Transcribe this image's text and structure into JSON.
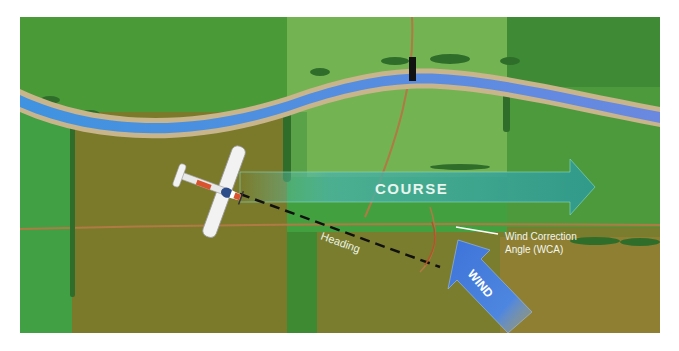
{
  "diagram": {
    "type": "wind-correction-illustration",
    "labels": {
      "course": "COURSE",
      "heading": "Heading",
      "wca_line1": "Wind Correction",
      "wca_line2": "Angle (WCA)",
      "wind": "WIND"
    },
    "colors": {
      "background": "#ffffff",
      "field_dark_green": "#3f8a35",
      "field_green": "#4aa03c",
      "field_light_green": "#6db04e",
      "field_olive": "#6e7a25",
      "field_brown": "#8a7a2e",
      "river": "#4a8fe0",
      "river_bank": "#c8b58c",
      "road": "#b87a45",
      "course_arrow": "#3ba597",
      "wind_arrow": "#3f77d6",
      "heading_line": "#111111",
      "label_text": "#ffffff",
      "tree": "#2f6e2a",
      "bridge": "#111111"
    },
    "elements": [
      "river",
      "bridge",
      "dirt-roads",
      "tree-lines",
      "airplane",
      "course-arrow",
      "heading-line",
      "wind-arrow",
      "wca-arc"
    ]
  }
}
